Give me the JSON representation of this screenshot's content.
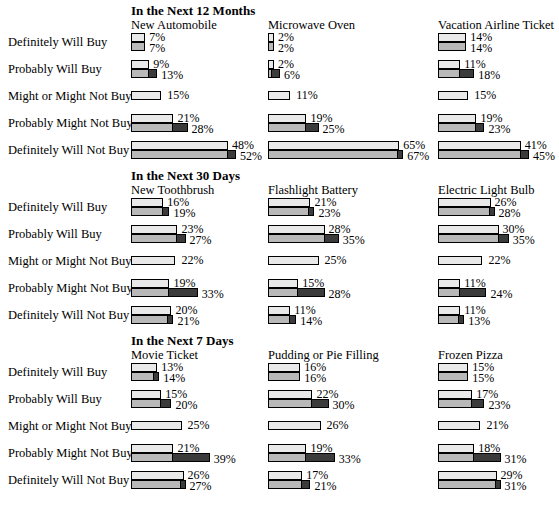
{
  "chart_data": {
    "type": "bar",
    "xlabel": "",
    "ylabel": "",
    "grid": false,
    "legend": "none",
    "units": "percent",
    "value_suffix": "%",
    "bar_scale_px_per_percent": 2.02,
    "categories": [
      "Definitely Will Buy",
      "Probably Will Buy",
      "Might or Might Not Buy",
      "Probably Might Not Buy",
      "Definitely Will Not Buy"
    ],
    "series_names": [
      "upper",
      "lower"
    ],
    "sections": [
      {
        "heading": "In the Next 12 Months",
        "columns": [
          {
            "title": "New Automobile",
            "rows": [
              {
                "category": "Definitely Will Buy",
                "upper": 7,
                "lower": 7,
                "upper_label": "7%",
                "lower_label": "7%"
              },
              {
                "category": "Probably Will Buy",
                "upper": 9,
                "lower": 13,
                "upper_label": "9%",
                "lower_label": "13%"
              },
              {
                "category": "Might or Might Not Buy",
                "upper": 15,
                "lower": null,
                "upper_label": "15%",
                "lower_label": null
              },
              {
                "category": "Probably Might Not Buy",
                "upper": 21,
                "lower": 28,
                "upper_label": "21%",
                "lower_label": "28%"
              },
              {
                "category": "Definitely Will Not Buy",
                "upper": 48,
                "lower": 52,
                "upper_label": "48%",
                "lower_label": "52%"
              }
            ]
          },
          {
            "title": "Microwave Oven",
            "rows": [
              {
                "category": "Definitely Will Buy",
                "upper": 2,
                "lower": 2,
                "upper_label": "2%",
                "lower_label": "2%"
              },
              {
                "category": "Probably Will Buy",
                "upper": 2,
                "lower": 6,
                "upper_label": "2%",
                "lower_label": "6%"
              },
              {
                "category": "Might or Might Not Buy",
                "upper": 11,
                "lower": null,
                "upper_label": "11%",
                "lower_label": null
              },
              {
                "category": "Probably Might Not Buy",
                "upper": 19,
                "lower": 25,
                "upper_label": "19%",
                "lower_label": "25%"
              },
              {
                "category": "Definitely Will Not Buy",
                "upper": 65,
                "lower": 67,
                "upper_label": "65%",
                "lower_label": "67%"
              }
            ]
          },
          {
            "title": "Vacation Airline Ticket",
            "rows": [
              {
                "category": "Definitely Will Buy",
                "upper": 14,
                "lower": 14,
                "upper_label": "14%",
                "lower_label": "14%"
              },
              {
                "category": "Probably Will Buy",
                "upper": 11,
                "lower": 18,
                "upper_label": "11%",
                "lower_label": "18%"
              },
              {
                "category": "Might or Might Not Buy",
                "upper": 15,
                "lower": null,
                "upper_label": "15%",
                "lower_label": null
              },
              {
                "category": "Probably Might Not Buy",
                "upper": 19,
                "lower": 23,
                "upper_label": "19%",
                "lower_label": "23%"
              },
              {
                "category": "Definitely Will Not Buy",
                "upper": 41,
                "lower": 45,
                "upper_label": "41%",
                "lower_label": "45%"
              }
            ]
          }
        ]
      },
      {
        "heading": "In the Next 30 Days",
        "columns": [
          {
            "title": "New Toothbrush",
            "rows": [
              {
                "category": "Definitely Will Buy",
                "upper": 16,
                "lower": 19,
                "upper_label": "16%",
                "lower_label": "19%"
              },
              {
                "category": "Probably Will Buy",
                "upper": 23,
                "lower": 27,
                "upper_label": "23%",
                "lower_label": "27%"
              },
              {
                "category": "Might or Might Not Buy",
                "upper": 22,
                "lower": null,
                "upper_label": "22%",
                "lower_label": null
              },
              {
                "category": "Probably Might Not Buy",
                "upper": 19,
                "lower": 33,
                "upper_label": "19%",
                "lower_label": "33%"
              },
              {
                "category": "Definitely Will Not Buy",
                "upper": 20,
                "lower": 21,
                "upper_label": "20%",
                "lower_label": "21%"
              }
            ]
          },
          {
            "title": "Flashlight Battery",
            "rows": [
              {
                "category": "Definitely Will Buy",
                "upper": 21,
                "lower": 23,
                "upper_label": "21%",
                "lower_label": "23%"
              },
              {
                "category": "Probably Will Buy",
                "upper": 28,
                "lower": 35,
                "upper_label": "28%",
                "lower_label": "35%"
              },
              {
                "category": "Might or Might Not Buy",
                "upper": 25,
                "lower": null,
                "upper_label": "25%",
                "lower_label": null
              },
              {
                "category": "Probably Might Not Buy",
                "upper": 15,
                "lower": 28,
                "upper_label": "15%",
                "lower_label": "28%"
              },
              {
                "category": "Definitely Will Not Buy",
                "upper": 11,
                "lower": 14,
                "upper_label": "11%",
                "lower_label": "14%"
              }
            ]
          },
          {
            "title": "Electric Light Bulb",
            "rows": [
              {
                "category": "Definitely Will Buy",
                "upper": 26,
                "lower": 28,
                "upper_label": "26%",
                "lower_label": "28%"
              },
              {
                "category": "Probably Will Buy",
                "upper": 30,
                "lower": 35,
                "upper_label": "30%",
                "lower_label": "35%"
              },
              {
                "category": "Might or Might Not Buy",
                "upper": 22,
                "lower": null,
                "upper_label": "22%",
                "lower_label": null
              },
              {
                "category": "Probably Might Not Buy",
                "upper": 11,
                "lower": 24,
                "upper_label": "11%",
                "lower_label": "24%"
              },
              {
                "category": "Definitely Will Not Buy",
                "upper": 11,
                "lower": 13,
                "upper_label": "11%",
                "lower_label": "13%"
              }
            ]
          }
        ]
      },
      {
        "heading": "In the Next 7 Days",
        "columns": [
          {
            "title": "Movie Ticket",
            "rows": [
              {
                "category": "Definitely Will Buy",
                "upper": 13,
                "lower": 14,
                "upper_label": "13%",
                "lower_label": "14%"
              },
              {
                "category": "Probably Will Buy",
                "upper": 15,
                "lower": 20,
                "upper_label": "15%",
                "lower_label": "20%"
              },
              {
                "category": "Might or Might Not Buy",
                "upper": 25,
                "lower": null,
                "upper_label": "25%",
                "lower_label": null
              },
              {
                "category": "Probably Might Not Buy",
                "upper": 21,
                "lower": 39,
                "upper_label": "21%",
                "lower_label": "39%"
              },
              {
                "category": "Definitely Will Not Buy",
                "upper": 26,
                "lower": 27,
                "upper_label": "26%",
                "lower_label": "27%"
              }
            ]
          },
          {
            "title": "Pudding or Pie Filling",
            "rows": [
              {
                "category": "Definitely Will Buy",
                "upper": 16,
                "lower": 16,
                "upper_label": "16%",
                "lower_label": "16%"
              },
              {
                "category": "Probably Will Buy",
                "upper": 22,
                "lower": 30,
                "upper_label": "22%",
                "lower_label": "30%"
              },
              {
                "category": "Might or Might Not Buy",
                "upper": 26,
                "lower": null,
                "upper_label": "26%",
                "lower_label": null
              },
              {
                "category": "Probably Might Not Buy",
                "upper": 19,
                "lower": 33,
                "upper_label": "19%",
                "lower_label": "33%"
              },
              {
                "category": "Definitely Will Not Buy",
                "upper": 17,
                "lower": 21,
                "upper_label": "17%",
                "lower_label": "21%"
              }
            ]
          },
          {
            "title": "Frozen Pizza",
            "rows": [
              {
                "category": "Definitely Will Buy",
                "upper": 15,
                "lower": 15,
                "upper_label": "15%",
                "lower_label": "15%"
              },
              {
                "category": "Probably Will Buy",
                "upper": 17,
                "lower": 23,
                "upper_label": "17%",
                "lower_label": "23%"
              },
              {
                "category": "Might or Might Not Buy",
                "upper": 21,
                "lower": null,
                "upper_label": "21%",
                "lower_label": null
              },
              {
                "category": "Probably Might Not Buy",
                "upper": 18,
                "lower": 31,
                "upper_label": "18%",
                "lower_label": "31%"
              },
              {
                "category": "Definitely Will Not Buy",
                "upper": 29,
                "lower": 31,
                "upper_label": "29%",
                "lower_label": "31%"
              }
            ]
          }
        ]
      }
    ],
    "colors": {
      "upper_bar": "#e9e9e9",
      "lower_bar": "#b9b9b9",
      "increment": "#3b3b3b",
      "outline": "#000000",
      "background": "#ffffff",
      "text": "#000000"
    }
  }
}
